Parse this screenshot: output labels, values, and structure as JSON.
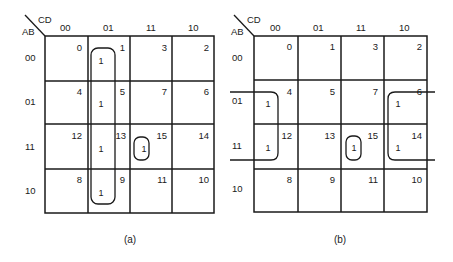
{
  "diagram": {
    "colors": {
      "ink": "#1a1a1a",
      "background": "#ffffff"
    },
    "maps": [
      {
        "id": "a",
        "caption": "(a)",
        "corner": {
          "top_label": "CD",
          "left_label": "AB"
        },
        "col_headers": [
          "00",
          "01",
          "11",
          "10"
        ],
        "row_headers": [
          "00",
          "01",
          "11",
          "10"
        ],
        "cells": [
          [
            {
              "n": "0",
              "v": ""
            },
            {
              "n": "1",
              "v": "1"
            },
            {
              "n": "3",
              "v": ""
            },
            {
              "n": "2",
              "v": ""
            }
          ],
          [
            {
              "n": "4",
              "v": ""
            },
            {
              "n": "5",
              "v": "1"
            },
            {
              "n": "7",
              "v": ""
            },
            {
              "n": "6",
              "v": ""
            }
          ],
          [
            {
              "n": "12",
              "v": ""
            },
            {
              "n": "13",
              "v": "1"
            },
            {
              "n": "15",
              "v": "1"
            },
            {
              "n": "14",
              "v": ""
            }
          ],
          [
            {
              "n": "8",
              "v": ""
            },
            {
              "n": "9",
              "v": "1"
            },
            {
              "n": "11",
              "v": ""
            },
            {
              "n": "10",
              "v": ""
            }
          ]
        ],
        "groupings": [
          {
            "name": "column-01-group",
            "cells": [
              1,
              5,
              13,
              9
            ]
          },
          {
            "name": "single-15-group",
            "cells": [
              15
            ]
          }
        ]
      },
      {
        "id": "b",
        "caption": "(b)",
        "corner": {
          "top_label": "CD",
          "left_label": "AB"
        },
        "col_headers": [
          "00",
          "01",
          "11",
          "10"
        ],
        "row_headers": [
          "00",
          "01",
          "11",
          "10"
        ],
        "cells": [
          [
            {
              "n": "0",
              "v": ""
            },
            {
              "n": "1",
              "v": ""
            },
            {
              "n": "3",
              "v": ""
            },
            {
              "n": "2",
              "v": ""
            }
          ],
          [
            {
              "n": "4",
              "v": "1"
            },
            {
              "n": "5",
              "v": ""
            },
            {
              "n": "7",
              "v": ""
            },
            {
              "n": "6",
              "v": "1"
            }
          ],
          [
            {
              "n": "12",
              "v": "1"
            },
            {
              "n": "13",
              "v": ""
            },
            {
              "n": "15",
              "v": "1"
            },
            {
              "n": "14",
              "v": "1"
            }
          ],
          [
            {
              "n": "8",
              "v": ""
            },
            {
              "n": "9",
              "v": ""
            },
            {
              "n": "11",
              "v": ""
            },
            {
              "n": "10",
              "v": ""
            }
          ]
        ],
        "groupings": [
          {
            "name": "wraparound-edge-group",
            "cells": [
              4,
              12,
              6,
              14
            ]
          },
          {
            "name": "single-15-group",
            "cells": [
              15
            ]
          }
        ]
      }
    ]
  }
}
